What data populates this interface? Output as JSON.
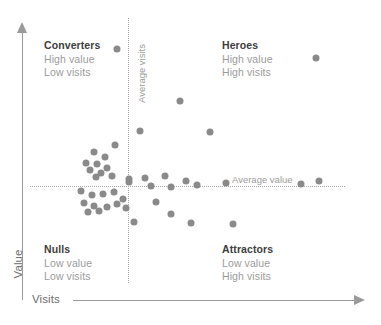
{
  "axes": {
    "y_label": "Value",
    "x_label": "Visits",
    "y_arrow_icon": "arrow-up-icon",
    "x_arrow_icon": "arrow-right-icon"
  },
  "reference_lines": {
    "vertical_label": "Average visits",
    "horizontal_label": "Average value"
  },
  "quadrants": [
    {
      "key": "converters",
      "title": "Converters",
      "line1": "High value",
      "line2": "Low visits"
    },
    {
      "key": "heroes",
      "title": "Heroes",
      "line1": "High value",
      "line2": "High visits"
    },
    {
      "key": "nulls",
      "title": "Nulls",
      "line1": "Low value",
      "line2": "Low visits"
    },
    {
      "key": "attractors",
      "title": "Attractors",
      "line1": "Low value",
      "line2": "High visits"
    }
  ],
  "colors": {
    "dot": "#8a8a8a",
    "axis": "#9a9a9a",
    "reference_line": "#a8a8a8",
    "title_text": "#3d3d3d",
    "muted_text": "#9b9b9b",
    "background": "#ffffff"
  },
  "chart_data": {
    "type": "scatter",
    "title": "",
    "subtitle": "",
    "xlabel": "Visits",
    "ylabel": "Value",
    "xlim": [
      0,
      100
    ],
    "ylim": [
      0,
      100
    ],
    "grid": false,
    "legend": "none",
    "annotations": [
      {
        "text": "Average visits",
        "orientation": "vertical",
        "type": "reference-line-label"
      },
      {
        "text": "Average value",
        "orientation": "horizontal",
        "type": "reference-line-label"
      },
      {
        "text": "Converters",
        "quadrant": "top-left",
        "detail": "High value / Low visits"
      },
      {
        "text": "Heroes",
        "quadrant": "top-right",
        "detail": "High value / High visits"
      },
      {
        "text": "Nulls",
        "quadrant": "bottom-left",
        "detail": "Low value / Low visits"
      },
      {
        "text": "Attractors",
        "quadrant": "bottom-right",
        "detail": "Low value / High visits"
      }
    ],
    "reference_lines": {
      "vertical_x": 32.0,
      "horizontal_y": 43.0
    },
    "series": [
      {
        "name": "Pages",
        "marker": "circle",
        "color": "#8a8a8a",
        "points": [
          {
            "x": 27.7,
            "y": 93.6
          },
          {
            "x": 90.8,
            "y": 89.8
          },
          {
            "x": 47.6,
            "y": 73.1
          },
          {
            "x": 34.9,
            "y": 61.7
          },
          {
            "x": 57.0,
            "y": 61.3
          },
          {
            "x": 27.1,
            "y": 56.1
          },
          {
            "x": 20.2,
            "y": 53.5
          },
          {
            "x": 23.7,
            "y": 51.6
          },
          {
            "x": 17.9,
            "y": 49.3
          },
          {
            "x": 21.4,
            "y": 48.9
          },
          {
            "x": 24.3,
            "y": 47.4
          },
          {
            "x": 19.1,
            "y": 46.6
          },
          {
            "x": 22.5,
            "y": 45.5
          },
          {
            "x": 26.0,
            "y": 44.3
          },
          {
            "x": 20.8,
            "y": 43.9
          },
          {
            "x": 31.4,
            "y": 43.2
          },
          {
            "x": 31.4,
            "y": 41.7
          },
          {
            "x": 36.6,
            "y": 43.5
          },
          {
            "x": 43.0,
            "y": 44.3
          },
          {
            "x": 49.4,
            "y": 42.4
          },
          {
            "x": 38.4,
            "y": 40.2
          },
          {
            "x": 44.7,
            "y": 39.8
          },
          {
            "x": 52.9,
            "y": 40.6
          },
          {
            "x": 62.2,
            "y": 41.3
          },
          {
            "x": 86.0,
            "y": 41.0
          },
          {
            "x": 91.9,
            "y": 42.1
          },
          {
            "x": 16.2,
            "y": 38.3
          },
          {
            "x": 19.7,
            "y": 36.8
          },
          {
            "x": 23.1,
            "y": 37.2
          },
          {
            "x": 26.6,
            "y": 37.9
          },
          {
            "x": 29.5,
            "y": 35.3
          },
          {
            "x": 17.3,
            "y": 33.8
          },
          {
            "x": 20.2,
            "y": 32.7
          },
          {
            "x": 24.3,
            "y": 32.3
          },
          {
            "x": 27.7,
            "y": 33.4
          },
          {
            "x": 30.6,
            "y": 31.9
          },
          {
            "x": 18.5,
            "y": 30.4
          },
          {
            "x": 22.0,
            "y": 30.8
          },
          {
            "x": 40.1,
            "y": 34.2
          },
          {
            "x": 44.7,
            "y": 29.3
          },
          {
            "x": 33.1,
            "y": 26.3
          },
          {
            "x": 51.2,
            "y": 25.9
          },
          {
            "x": 64.5,
            "y": 25.5
          }
        ]
      }
    ]
  }
}
